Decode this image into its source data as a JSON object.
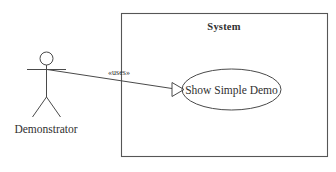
{
  "diagram": {
    "kind": "uml-use-case-diagram",
    "background_color": "#ffffff",
    "stroke_color": "#4a4a4a",
    "text_color": "#303030",
    "system_boundary": {
      "label": "System",
      "x": 121,
      "y": 13,
      "width": 207,
      "height": 144
    },
    "actor": {
      "label": "Demonstrator",
      "head_center_x": 46.5,
      "head_center_y": 58.5,
      "head_radius": 6.5,
      "arms_y": 69,
      "arms_left_x": 27,
      "arms_right_x": 66,
      "body_bottom_y": 97,
      "legs_spread": 14,
      "legs_bottom_y": 117,
      "label_x": 5,
      "label_y": 133
    },
    "use_case": {
      "label": "Show Simple Demo",
      "center_x": 231.5,
      "center_y": 89.5,
      "rx": 49.5,
      "ry": 20.5
    },
    "association": {
      "label": "«uses»",
      "label_x": 101,
      "label_y": 76,
      "from_x": 47,
      "from_y": 69.5,
      "to_x": 172,
      "to_y": 88.5,
      "arrowhead": "hollow-triangle",
      "arrow_tip_x": 184,
      "arrow_tip_y": 89.5,
      "arrow_back_x": 172,
      "arrow_half_height": 7
    }
  }
}
